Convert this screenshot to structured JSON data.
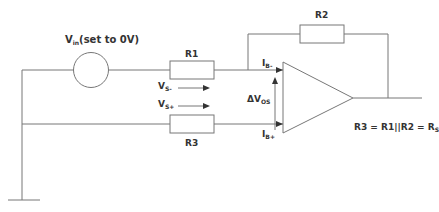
{
  "diagram": {
    "source_label": {
      "main": "V",
      "sub": "in",
      "suffix": "(set to 0V)"
    },
    "resistors": {
      "r1": "R1",
      "r2": "R2",
      "r3": "R3"
    },
    "labels": {
      "vs_minus": {
        "main": "V",
        "sub": "S-"
      },
      "vs_plus": {
        "main": "V",
        "sub": "S+"
      },
      "ib_minus": {
        "main": "I",
        "sub": "B-"
      },
      "ib_plus": {
        "main": "I",
        "sub": "B+"
      },
      "delta_vos": {
        "main": "ΔV",
        "sub": "OS"
      }
    },
    "equation": {
      "text": "R3 = R1||R2 = R",
      "sub": "S"
    },
    "colors": {
      "line": "#777777",
      "text": "#333333",
      "background": "#ffffff"
    }
  }
}
